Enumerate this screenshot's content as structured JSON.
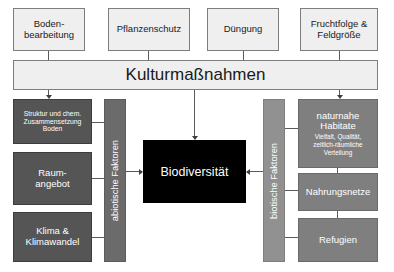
{
  "diagram": {
    "colors": {
      "background": "#ffffff",
      "light_box": "#efefef",
      "dark_box": "#555555",
      "mid_box": "#7f7f7f",
      "spine_dark": "#6b6b6b",
      "spine_mid": "#919191",
      "center_box": "#000000",
      "connector": "#5a5a5a",
      "light_text": "#1a1a1a",
      "inverse_text": "#ffffff"
    }
  },
  "management": {
    "inputs": [
      {
        "id": "bodenbearbeitung",
        "lines": [
          "Boden-",
          "bearbeitung"
        ]
      },
      {
        "id": "pflanzenschutz",
        "lines": [
          "Pflanzenschutz"
        ]
      },
      {
        "id": "duengung",
        "lines": [
          "Düngung"
        ]
      },
      {
        "id": "fruchtfolge",
        "lines": [
          "Fruchtfolge &",
          "Feldgröße"
        ]
      }
    ],
    "banner_label": "Kulturmaßnahmen"
  },
  "center": {
    "label": "Biodiversität"
  },
  "abiotic": {
    "spine_label": "abiotische Faktoren",
    "factors": [
      {
        "id": "bodenstruktur",
        "lines": [
          "Struktur und chem.",
          "Zusammensetzung",
          "Boden"
        ],
        "sub": ""
      },
      {
        "id": "raumangebot",
        "lines": [
          "Raum-",
          "angebot"
        ],
        "sub": ""
      },
      {
        "id": "klima",
        "lines": [
          "Klima &",
          "Klimawandel"
        ],
        "sub": ""
      }
    ]
  },
  "biotic": {
    "spine_label": "biotische Faktoren",
    "factors": [
      {
        "id": "habitate",
        "lines": [
          "naturnahe",
          "Habitate"
        ],
        "sub": [
          "Vielfalt, Qualität,",
          "zeitlich-räumliche",
          "Verteilung"
        ]
      },
      {
        "id": "nahrungsnetze",
        "lines": [
          "Nahrungsnetze"
        ],
        "sub": []
      },
      {
        "id": "refugien",
        "lines": [
          "Refugien"
        ],
        "sub": []
      }
    ]
  }
}
